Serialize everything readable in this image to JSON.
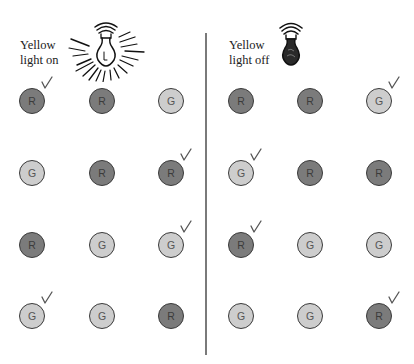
{
  "panels": [
    {
      "label_line1": "Yellow",
      "label_line2": "light on",
      "bulb": "light-bulb-on-icon",
      "grid": [
        [
          {
            "letter": "R",
            "checked": true
          },
          {
            "letter": "R",
            "checked": false
          },
          {
            "letter": "G",
            "checked": false
          }
        ],
        [
          {
            "letter": "G",
            "checked": false
          },
          {
            "letter": "R",
            "checked": false
          },
          {
            "letter": "R",
            "checked": true
          }
        ],
        [
          {
            "letter": "R",
            "checked": false
          },
          {
            "letter": "G",
            "checked": false
          },
          {
            "letter": "G",
            "checked": true
          }
        ],
        [
          {
            "letter": "G",
            "checked": true
          },
          {
            "letter": "G",
            "checked": false
          },
          {
            "letter": "R",
            "checked": false
          }
        ]
      ]
    },
    {
      "label_line1": "Yellow",
      "label_line2": "light off",
      "bulb": "light-bulb-off-icon",
      "grid": [
        [
          {
            "letter": "R",
            "checked": false
          },
          {
            "letter": "R",
            "checked": false
          },
          {
            "letter": "G",
            "checked": true
          }
        ],
        [
          {
            "letter": "G",
            "checked": true
          },
          {
            "letter": "R",
            "checked": false
          },
          {
            "letter": "R",
            "checked": false
          }
        ],
        [
          {
            "letter": "R",
            "checked": true
          },
          {
            "letter": "G",
            "checked": false
          },
          {
            "letter": "G",
            "checked": false
          }
        ],
        [
          {
            "letter": "G",
            "checked": false
          },
          {
            "letter": "G",
            "checked": false
          },
          {
            "letter": "R",
            "checked": true
          }
        ]
      ]
    }
  ],
  "colors": {
    "R": "#7b7b7b",
    "G": "#cdcdcd",
    "outline": "#3a3a3a",
    "divider": "#7a7a7a"
  }
}
